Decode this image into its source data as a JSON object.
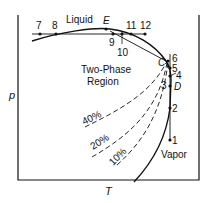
{
  "axes": {
    "x_label": "T",
    "y_label": "p"
  },
  "regions": {
    "liquid": "Liquid",
    "two_phase_line1": "Two-Phase",
    "two_phase_line2": "Region",
    "vapor": "Vapor"
  },
  "points": {
    "p7": "7",
    "p8": "8",
    "E": "E",
    "p9": "9",
    "p10": "10",
    "p11": "11",
    "p12": "12",
    "C": "C",
    "p6": "6",
    "p5": "5",
    "p4": "4",
    "D": "D",
    "p3": "3",
    "p2": "2",
    "p1": "1"
  },
  "quality_lines": {
    "q40": "40%",
    "q20": "20%",
    "q10": "10%"
  }
}
